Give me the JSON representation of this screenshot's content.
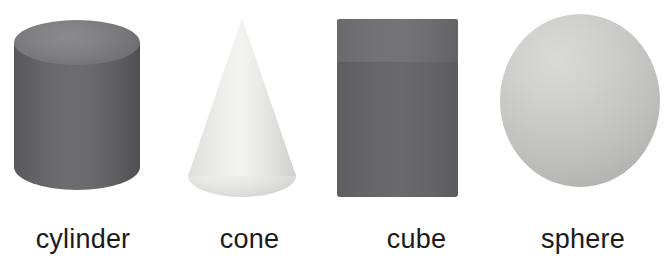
{
  "page": {
    "background_color": "#ffffff",
    "text_color": "#1a1a1a"
  },
  "shapes": [
    {
      "id": "cylinder",
      "label": "cylinder",
      "icon_name": "cylinder-shape",
      "color": "#6a6a6c",
      "highlight_color": "#8b8b8d",
      "shade": "dark-gray"
    },
    {
      "id": "cone",
      "label": "cone",
      "icon_name": "cone-shape",
      "color": "#ededec",
      "highlight_color": "#f3f3f2",
      "shade": "light-gray"
    },
    {
      "id": "cube",
      "label": "cube",
      "icon_name": "cube-shape",
      "color": "#666668",
      "highlight_color": "#747476",
      "shade": "dark-gray"
    },
    {
      "id": "sphere",
      "label": "sphere",
      "icon_name": "sphere-shape",
      "color": "#c4c4c3",
      "highlight_color": "#d9d9d8",
      "shade": "medium-gray"
    }
  ]
}
